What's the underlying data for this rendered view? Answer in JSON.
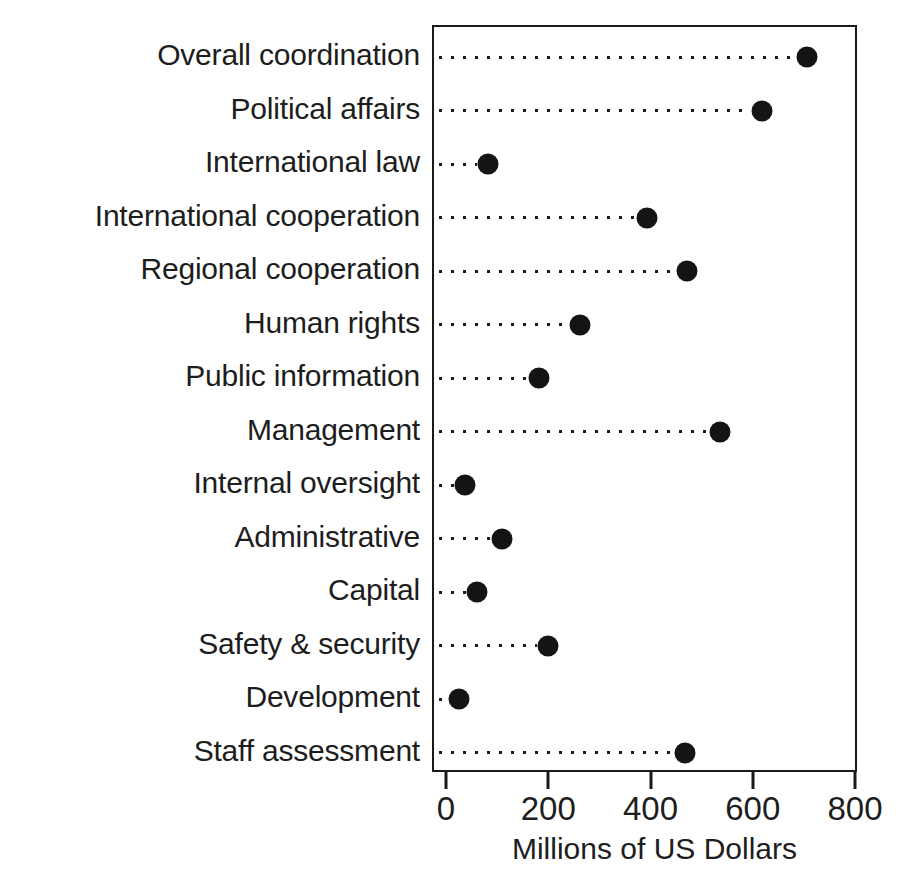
{
  "chart_data": {
    "type": "scatter",
    "subtype": "dot-plot",
    "title": "",
    "xlabel": "Millions of US Dollars",
    "ylabel": "",
    "xlim": [
      0,
      800
    ],
    "xticks": [
      0,
      200,
      400,
      600,
      800
    ],
    "xtick_labels": [
      "0",
      "200",
      "400",
      "600",
      "800"
    ],
    "grid": false,
    "legend": null,
    "leader_lines": "dotted",
    "marker": {
      "shape": "circle",
      "color": "#141414",
      "size_px": 21
    },
    "categories": [
      "Overall coordination",
      "Political affairs",
      "International law",
      "International cooperation",
      "Regional cooperation",
      "Human rights",
      "Public information",
      "Management",
      "Internal oversight",
      "Administrative",
      "Capital",
      "Safety & security",
      "Development",
      "Staff assessment"
    ],
    "values": [
      703,
      615,
      78,
      390,
      468,
      258,
      178,
      533,
      33,
      105,
      57,
      196,
      22,
      463
    ]
  }
}
